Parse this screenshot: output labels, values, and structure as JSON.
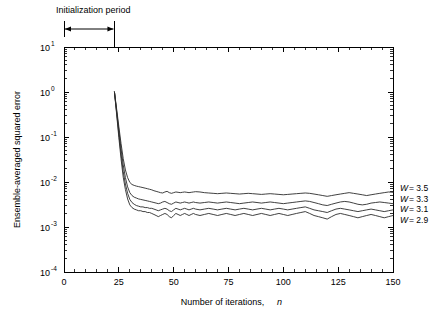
{
  "figure": {
    "background_color": "#ffffff",
    "line_color": "#2b2b2b",
    "axis_color": "#000000"
  },
  "annotation": {
    "initialization_label": "Initialization period",
    "span_start_n": 0,
    "span_end_n": 23
  },
  "axes": {
    "x_title_main": "Number of iterations,",
    "x_title_var": "n",
    "y_title": "Ensemble-averaged squared error",
    "x_tick_labels": [
      "0",
      "25",
      "50",
      "75",
      "100",
      "125",
      "150"
    ],
    "y_tick_labels": [
      {
        "mantissa": "10",
        "exponent": "1"
      },
      {
        "mantissa": "10",
        "exponent": "0"
      },
      {
        "mantissa": "10",
        "exponent": "-1"
      },
      {
        "mantissa": "10",
        "exponent": "-2"
      },
      {
        "mantissa": "10",
        "exponent": "-3"
      },
      {
        "mantissa": "10",
        "exponent": "-4"
      }
    ]
  },
  "legend": {
    "entries": [
      {
        "var": "W",
        "eq": "= 3.5"
      },
      {
        "var": "W",
        "eq": "= 3.3"
      },
      {
        "var": "W",
        "eq": "= 3.1"
      },
      {
        "var": "W",
        "eq": "= 2.9"
      }
    ]
  },
  "chart_data": {
    "type": "line",
    "title": "",
    "xlabel": "Number of iterations, n",
    "ylabel": "Ensemble-averaged squared error",
    "xlim": [
      0,
      150
    ],
    "ylim": [
      0.0001,
      10
    ],
    "yscale": "log",
    "xscale": "linear",
    "grid": false,
    "legend_position": "right-outside",
    "xticks": [
      0,
      25,
      50,
      75,
      100,
      125,
      150
    ],
    "yticks": [
      0.0001,
      0.001,
      0.01,
      0.1,
      1,
      10
    ],
    "annotations": [
      {
        "text": "Initialization period",
        "x_start": 0,
        "x_end": 23,
        "type": "span-arrow"
      }
    ],
    "series": [
      {
        "name": "W = 3.5",
        "x": [
          23,
          24,
          25,
          26,
          27,
          28,
          29,
          30,
          31,
          32,
          33,
          34,
          35,
          36,
          37,
          38,
          39,
          40,
          41,
          42,
          43,
          44,
          45,
          46,
          47,
          48,
          49,
          50,
          51,
          52,
          53,
          54,
          55,
          56,
          57,
          58,
          59,
          60,
          62,
          64,
          66,
          68,
          70,
          72,
          74,
          76,
          78,
          80,
          82,
          84,
          86,
          88,
          90,
          92,
          94,
          96,
          98,
          100,
          102,
          104,
          106,
          108,
          110,
          112,
          114,
          116,
          118,
          120,
          122,
          124,
          126,
          128,
          130,
          132,
          134,
          136,
          138,
          140,
          142,
          144,
          146,
          148,
          150
        ],
        "y": [
          1.0,
          0.42,
          0.17,
          0.072,
          0.033,
          0.0185,
          0.0125,
          0.0098,
          0.0088,
          0.0084,
          0.0081,
          0.0079,
          0.0077,
          0.0075,
          0.0073,
          0.0071,
          0.0069,
          0.0067,
          0.0064,
          0.0062,
          0.006,
          0.0058,
          0.0057,
          0.006,
          0.0062,
          0.0058,
          0.0056,
          0.0058,
          0.006,
          0.0059,
          0.0058,
          0.0059,
          0.006,
          0.0059,
          0.0058,
          0.0059,
          0.006,
          0.0061,
          0.006,
          0.0058,
          0.0057,
          0.0056,
          0.0055,
          0.0056,
          0.0057,
          0.0056,
          0.0055,
          0.0054,
          0.0055,
          0.0056,
          0.0055,
          0.0054,
          0.0053,
          0.0054,
          0.0055,
          0.0054,
          0.0053,
          0.0052,
          0.0053,
          0.0054,
          0.0055,
          0.0056,
          0.0057,
          0.0056,
          0.0054,
          0.0052,
          0.005,
          0.0048,
          0.005,
          0.0052,
          0.0054,
          0.0056,
          0.0058,
          0.0056,
          0.0054,
          0.0052,
          0.005,
          0.0052,
          0.0054,
          0.0056,
          0.0058,
          0.006,
          0.0059
        ]
      },
      {
        "name": "W = 3.3",
        "x": [
          23,
          24,
          25,
          26,
          27,
          28,
          29,
          30,
          31,
          32,
          33,
          34,
          35,
          36,
          37,
          38,
          39,
          40,
          41,
          42,
          43,
          44,
          45,
          46,
          47,
          48,
          49,
          50,
          51,
          52,
          53,
          54,
          55,
          56,
          57,
          58,
          59,
          60,
          62,
          64,
          66,
          68,
          70,
          72,
          74,
          76,
          78,
          80,
          82,
          84,
          86,
          88,
          90,
          92,
          94,
          96,
          98,
          100,
          102,
          104,
          106,
          108,
          110,
          112,
          114,
          116,
          118,
          120,
          122,
          124,
          126,
          128,
          130,
          132,
          134,
          136,
          138,
          140,
          142,
          144,
          146,
          148,
          150
        ],
        "y": [
          1.0,
          0.38,
          0.14,
          0.055,
          0.024,
          0.0125,
          0.0078,
          0.0058,
          0.005,
          0.0046,
          0.0044,
          0.0042,
          0.0041,
          0.004,
          0.0039,
          0.0038,
          0.0037,
          0.0036,
          0.0035,
          0.0034,
          0.0033,
          0.0034,
          0.0036,
          0.0037,
          0.0035,
          0.0033,
          0.0032,
          0.0034,
          0.0036,
          0.0035,
          0.0034,
          0.0035,
          0.0036,
          0.0035,
          0.0034,
          0.0035,
          0.0036,
          0.0035,
          0.0034,
          0.0035,
          0.0036,
          0.0035,
          0.0034,
          0.0035,
          0.0036,
          0.0035,
          0.0034,
          0.0033,
          0.0034,
          0.0035,
          0.0036,
          0.0035,
          0.0034,
          0.0035,
          0.0036,
          0.0035,
          0.0034,
          0.0033,
          0.0034,
          0.0035,
          0.0036,
          0.0037,
          0.0038,
          0.0037,
          0.0035,
          0.0033,
          0.0031,
          0.003,
          0.0032,
          0.0034,
          0.0036,
          0.0037,
          0.0036,
          0.0034,
          0.0032,
          0.0031,
          0.0032,
          0.0034,
          0.0035,
          0.0036,
          0.0035,
          0.0034,
          0.0033
        ]
      },
      {
        "name": "W = 3.1",
        "x": [
          23,
          24,
          25,
          26,
          27,
          28,
          29,
          30,
          31,
          32,
          33,
          34,
          35,
          36,
          37,
          38,
          39,
          40,
          41,
          42,
          43,
          44,
          45,
          46,
          47,
          48,
          49,
          50,
          51,
          52,
          53,
          54,
          55,
          56,
          57,
          58,
          59,
          60,
          62,
          64,
          66,
          68,
          70,
          72,
          74,
          76,
          78,
          80,
          82,
          84,
          86,
          88,
          90,
          92,
          94,
          96,
          98,
          100,
          102,
          104,
          106,
          108,
          110,
          112,
          114,
          116,
          118,
          120,
          122,
          124,
          126,
          128,
          130,
          132,
          134,
          136,
          138,
          140,
          142,
          144,
          146,
          148,
          150
        ],
        "y": [
          1.0,
          0.35,
          0.115,
          0.042,
          0.017,
          0.009,
          0.0056,
          0.0041,
          0.0035,
          0.0032,
          0.003,
          0.0029,
          0.0028,
          0.0028,
          0.0027,
          0.0027,
          0.0026,
          0.0026,
          0.0025,
          0.0024,
          0.0023,
          0.0024,
          0.0025,
          0.0026,
          0.0025,
          0.0023,
          0.0022,
          0.0024,
          0.0026,
          0.0025,
          0.0024,
          0.0025,
          0.0026,
          0.0025,
          0.0024,
          0.0025,
          0.0026,
          0.0025,
          0.0024,
          0.0025,
          0.0026,
          0.0025,
          0.0024,
          0.0025,
          0.0026,
          0.0025,
          0.0024,
          0.0025,
          0.0026,
          0.0025,
          0.0024,
          0.0025,
          0.0026,
          0.0025,
          0.0024,
          0.0025,
          0.0026,
          0.0025,
          0.0024,
          0.0025,
          0.0026,
          0.0027,
          0.0028,
          0.0026,
          0.0024,
          0.0023,
          0.0022,
          0.0021,
          0.0023,
          0.0025,
          0.0026,
          0.0025,
          0.0024,
          0.0023,
          0.0022,
          0.0023,
          0.0024,
          0.0025,
          0.0024,
          0.0023,
          0.0022,
          0.0023,
          0.0024
        ]
      },
      {
        "name": "W = 2.9",
        "x": [
          23,
          24,
          25,
          26,
          27,
          28,
          29,
          30,
          31,
          32,
          33,
          34,
          35,
          36,
          37,
          38,
          39,
          40,
          41,
          42,
          43,
          44,
          45,
          46,
          47,
          48,
          49,
          50,
          51,
          52,
          53,
          54,
          55,
          56,
          57,
          58,
          59,
          60,
          62,
          64,
          66,
          68,
          70,
          72,
          74,
          76,
          78,
          80,
          82,
          84,
          86,
          88,
          90,
          92,
          94,
          96,
          98,
          100,
          102,
          104,
          106,
          108,
          110,
          112,
          114,
          116,
          118,
          120,
          122,
          124,
          126,
          128,
          130,
          132,
          134,
          136,
          138,
          140,
          142,
          144,
          146,
          148,
          150
        ],
        "y": [
          1.0,
          0.32,
          0.098,
          0.033,
          0.0128,
          0.0068,
          0.0042,
          0.0031,
          0.0027,
          0.0025,
          0.0024,
          0.0023,
          0.0023,
          0.0022,
          0.0022,
          0.0021,
          0.0021,
          0.002,
          0.0019,
          0.0018,
          0.0017,
          0.0018,
          0.0019,
          0.002,
          0.0019,
          0.0017,
          0.0016,
          0.0018,
          0.002,
          0.0019,
          0.0018,
          0.0019,
          0.002,
          0.0019,
          0.0018,
          0.0019,
          0.002,
          0.0019,
          0.0018,
          0.0019,
          0.002,
          0.0019,
          0.0018,
          0.0019,
          0.002,
          0.0019,
          0.0018,
          0.0019,
          0.002,
          0.0019,
          0.0018,
          0.0019,
          0.002,
          0.0019,
          0.0018,
          0.0019,
          0.002,
          0.0019,
          0.0018,
          0.0019,
          0.002,
          0.0021,
          0.0022,
          0.002,
          0.0018,
          0.0017,
          0.0016,
          0.0015,
          0.0017,
          0.0019,
          0.002,
          0.0019,
          0.0018,
          0.0017,
          0.0016,
          0.0017,
          0.0018,
          0.0019,
          0.0018,
          0.0017,
          0.0016,
          0.0017,
          0.0018
        ]
      }
    ]
  }
}
